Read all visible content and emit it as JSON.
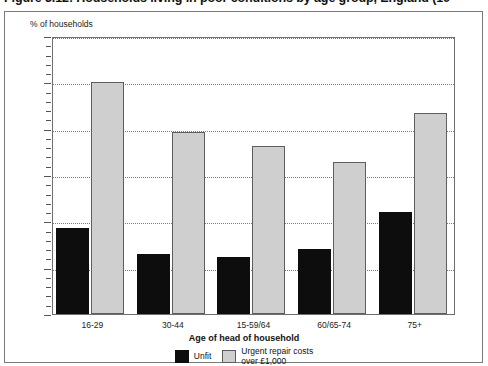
{
  "figure": {
    "title": "Figure 3.12: Households living in poor conditions by age group, England (19",
    "y_axis_caption": "% of households",
    "x_axis_title": "Age of head of household"
  },
  "legend": {
    "items": [
      {
        "label": "Unfit",
        "color": "#0d0d0d",
        "swatch": "black-square-icon"
      },
      {
        "label": "Urgent repair costs\nover £1,000",
        "color": "#cfcfcf",
        "swatch": "grey-square-icon"
      }
    ]
  },
  "axis": {
    "y_ticks": [
      "0",
      "5",
      "10",
      "15",
      "20",
      "25",
      "30"
    ],
    "y_minor_count": 4
  },
  "chart_data": {
    "type": "bar",
    "title": "Figure 3.12: Households living in poor conditions by age group, England (19",
    "xlabel": "Age of head of household",
    "ylabel": "% of households",
    "ylim": [
      0,
      30
    ],
    "ytick_step": 5,
    "grid": true,
    "legend_position": "bottom-center",
    "categories": [
      "16-29",
      "30-44",
      "15-59/64",
      "60/65-74",
      "75+"
    ],
    "series": [
      {
        "name": "Unfit",
        "color": "#0d0d0d",
        "values": [
          9.3,
          6.5,
          6.2,
          7.0,
          11.0
        ]
      },
      {
        "name": "Urgent repair costs over £1,000",
        "color": "#cfcfcf",
        "values": [
          25.0,
          19.6,
          18.1,
          16.4,
          21.7
        ]
      }
    ]
  }
}
